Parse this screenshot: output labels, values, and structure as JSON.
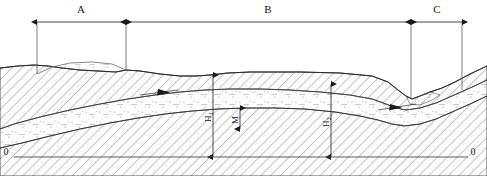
{
  "diagram": {
    "background_color": "#ffffff",
    "line_color": "#1a1a1a",
    "hatch_color": "#555555",
    "stipple_color": "#777777",
    "canvas": {
      "width": 487,
      "height": 176
    }
  },
  "horizontal_dimensions": {
    "line_y": 22,
    "items": [
      {
        "id": "A",
        "label": "A",
        "start_x": 37,
        "end_x": 126,
        "label_x": 81,
        "label_y": 13
      },
      {
        "id": "B",
        "label": "B",
        "start_x": 126,
        "end_x": 411,
        "label_x": 268,
        "label_y": 13
      },
      {
        "id": "C",
        "label": "C",
        "start_x": 411,
        "end_x": 462,
        "label_x": 437,
        "label_y": 13
      }
    ],
    "extension_lines": [
      {
        "x": 37,
        "y_top": 22,
        "y_bottom": 74
      },
      {
        "x": 126,
        "y_top": 22,
        "y_bottom": 70
      },
      {
        "x": 411,
        "y_top": 22,
        "y_bottom": 96
      },
      {
        "x": 462,
        "y_top": 22,
        "y_bottom": 90
      }
    ]
  },
  "vertical_dimensions": [
    {
      "id": "H1",
      "label": "H",
      "subscript": "1",
      "x": 213,
      "y_top": 75,
      "y_bottom": 157,
      "label_y": 117
    },
    {
      "id": "M",
      "label": "M",
      "subscript": "",
      "x": 240,
      "y_top": 108,
      "y_bottom": 129,
      "label_y": 120
    },
    {
      "id": "H2",
      "label": "H",
      "subscript": "2",
      "x": 331,
      "y_top": 84,
      "y_bottom": 157,
      "label_y": 122
    }
  ],
  "datum": {
    "baseline_y": 157,
    "left_label": "0",
    "right_label": "0",
    "left_label_x": 6,
    "right_label_x": 473,
    "label_y": 155,
    "line_start_x": 14,
    "line_end_x": 468
  },
  "strata": {
    "ground_surface": {
      "name": "ground-surface",
      "description": "upper terrain profile"
    },
    "upper_bedrock": {
      "name": "upper-bedrock-layer",
      "pattern": "diagonal-hatch"
    },
    "aquifer": {
      "name": "aquifer-layer",
      "pattern": "stipple-dot"
    },
    "lower_bedrock": {
      "name": "lower-bedrock-layer",
      "pattern": "diagonal-hatch"
    }
  },
  "flow_arrows": [
    {
      "id": "flow-1",
      "x": 160,
      "y": 92,
      "angle": 8
    },
    {
      "id": "flow-2",
      "x": 397,
      "y": 107,
      "angle": 8
    }
  ]
}
